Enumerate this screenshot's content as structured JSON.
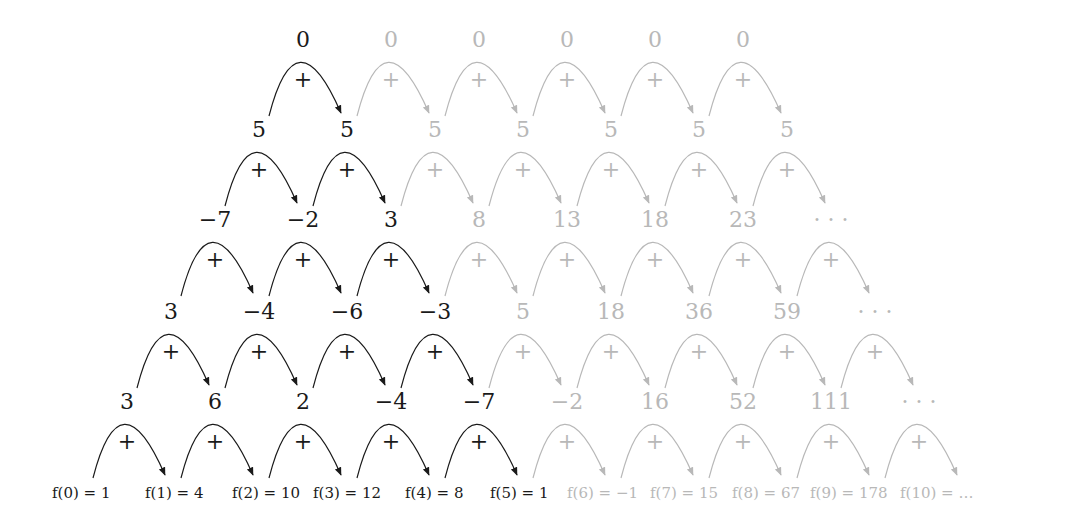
{
  "colors": {
    "dark": "#1a1a1a",
    "light": "#b8b8b8"
  },
  "layout": {
    "origin_x": 303,
    "col_step": 88,
    "row_shift": 44,
    "row_y": [
      40,
      130,
      220,
      312,
      402
    ],
    "fvals_y": 493
  },
  "rows": [
    {
      "labels": [
        "0",
        "0",
        "0",
        "0",
        "0",
        "0"
      ],
      "dark_labels": 1,
      "arcs": 6,
      "dark_arcs": 1
    },
    {
      "labels": [
        "5",
        "5",
        "5",
        "5",
        "5",
        "5",
        "5"
      ],
      "dark_labels": 2,
      "arcs": 7,
      "dark_arcs": 2
    },
    {
      "labels": [
        "−7",
        "−2",
        "3",
        "8",
        "13",
        "18",
        "23",
        "· · ·"
      ],
      "dark_labels": 3,
      "arcs": 8,
      "dark_arcs": 3
    },
    {
      "labels": [
        "3",
        "−4",
        "−6",
        "−3",
        "5",
        "18",
        "36",
        "59",
        "· · ·"
      ],
      "dark_labels": 4,
      "arcs": 9,
      "dark_arcs": 4
    },
    {
      "labels": [
        "3",
        "6",
        "2",
        "−4",
        "−7",
        "−2",
        "16",
        "52",
        "111",
        "· · ·"
      ],
      "dark_labels": 5,
      "arcs": 10,
      "dark_arcs": 5
    }
  ],
  "operator_label": "+",
  "function_values": [
    {
      "text": "f(0) = 1",
      "x": 52,
      "dark": true
    },
    {
      "text": "f(1) = 4",
      "x": 145,
      "dark": true
    },
    {
      "text": "f(2) = 10",
      "x": 232,
      "dark": true
    },
    {
      "text": "f(3) = 12",
      "x": 313,
      "dark": true
    },
    {
      "text": "f(4) = 8",
      "x": 405,
      "dark": true
    },
    {
      "text": "f(5) = 1",
      "x": 490,
      "dark": true
    },
    {
      "text": "f(6) = −1",
      "x": 567,
      "dark": false
    },
    {
      "text": "f(7) = 15",
      "x": 650,
      "dark": false
    },
    {
      "text": "f(8) = 67",
      "x": 732,
      "dark": false
    },
    {
      "text": "f(9) = 178",
      "x": 810,
      "dark": false
    },
    {
      "text": "f(10) = …",
      "x": 900,
      "dark": false
    }
  ]
}
